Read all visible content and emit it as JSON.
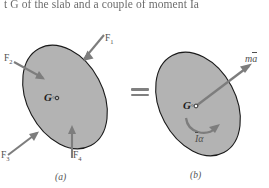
{
  "page": {
    "top_text": "t G of the slab and a couple of moment Ia",
    "background_color": "#ffffff",
    "body_fill_color": "#b3b3b3",
    "body_stroke_color": "#1a1a1a",
    "arrow_color": "#7d7d7d",
    "equals_sign": "="
  },
  "figure_a": {
    "caption": "(a)",
    "center_label": "G",
    "center_marker": "◦",
    "forces": [
      {
        "name": "F1",
        "label": "F",
        "subscript": "1",
        "direction": "down-left",
        "description": "force arrow at upper right pointing into the body"
      },
      {
        "name": "F2",
        "label": "F",
        "subscript": "2",
        "direction": "down-right",
        "description": "force arrow at upper left pointing into the body"
      },
      {
        "name": "F3",
        "label": "F",
        "subscript": "3",
        "direction": "up-right",
        "description": "force arrow at lower left pointing into the body"
      },
      {
        "name": "F4",
        "label": "F",
        "subscript": "4",
        "direction": "up",
        "description": "vertical force arrow at the bottom pointing into the body"
      }
    ]
  },
  "figure_b": {
    "caption": "(b)",
    "center_label": "G",
    "center_marker": "◦",
    "resultant_force_label": "m",
    "resultant_force_vector": "a",
    "resultant_couple_label": "I",
    "resultant_couple_symbol": "α",
    "resultant_force_description": "effective force vector m a-bar directed up and to the right from G",
    "resultant_couple_description": "curved arrow couple I-bar alpha below G, counterclockwise sense"
  }
}
